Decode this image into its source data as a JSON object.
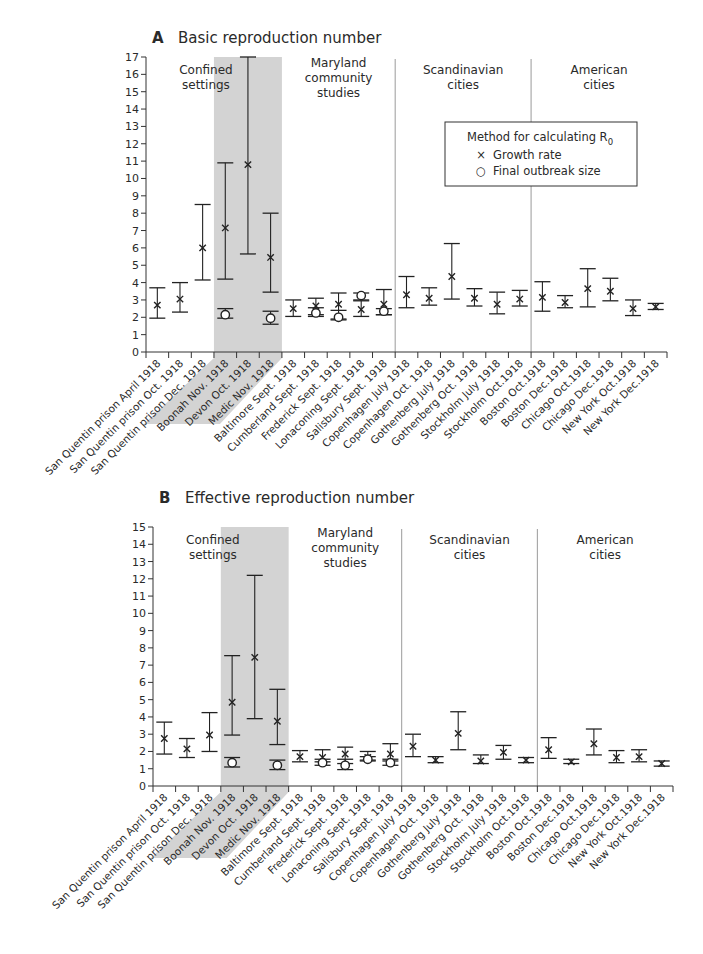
{
  "colors": {
    "axis": "#333333",
    "marker": "#222222",
    "shade": "#d3d3d3",
    "divider": "#9a9a9a",
    "text": "#2a2a2a"
  },
  "legend": {
    "title": "Method for calculating R",
    "title_subscript": "0",
    "items": [
      {
        "symbol": "×",
        "label": "Growth rate"
      },
      {
        "symbol": "○",
        "label": "Final outbreak size"
      }
    ]
  },
  "groups": [
    {
      "label_lines": [
        "Confined",
        "settings"
      ],
      "start": 0,
      "end": 6,
      "shaded_from": 3
    },
    {
      "label_lines": [
        "Maryland",
        "community",
        "studies"
      ],
      "start": 6,
      "end": 11
    },
    {
      "label_lines": [
        "Scandinavian",
        "cities"
      ],
      "start": 11,
      "end": 17
    },
    {
      "label_lines": [
        "American",
        "cities"
      ],
      "start": 17,
      "end": 23
    }
  ],
  "categories": [
    "San Quentin prison April 1918",
    "San Quentin prison Oct. 1918",
    "San Quentin prison Dec. 1918",
    "Boonah Nov. 1918",
    "Devon Oct. 1918",
    "Medic Nov. 1918",
    "Baltimore Sept. 1918",
    "Cumberland Sept. 1918",
    "Frederick Sept. 1918",
    "Lonaconing Sept. 1918",
    "Salisbury Sept. 1918",
    "Copenhagen July 1918",
    "Copenhagen Oct. 1918",
    "Gothenberg July 1918",
    "Gothenberg Oct. 1918",
    "Stockholm July 1918",
    "Stockholm Oct.1918",
    "Boston Oct.1918",
    "Boston Dec.1918",
    "Chicago Oct.1918",
    "Chicago Dec.1918",
    "New York Oct.1918",
    "New York Dec.1918"
  ],
  "chart_data": [
    {
      "type": "scatter",
      "panel": "A",
      "title": "Basic reproduction number",
      "xlabel": "",
      "ylabel": "",
      "ylim": [
        0,
        17
      ],
      "yticks": [
        0,
        1,
        2,
        3,
        4,
        5,
        6,
        7,
        8,
        9,
        10,
        11,
        12,
        13,
        14,
        15,
        16,
        17
      ],
      "grid": false,
      "legend_position": "upper right (inside, over Scandinavian/American divider)",
      "categories_ref": "categories",
      "series": [
        {
          "name": "Growth rate",
          "marker": "x",
          "points": [
            {
              "i": 0,
              "value": 2.7,
              "low": 1.95,
              "high": 3.7
            },
            {
              "i": 1,
              "value": 3.05,
              "low": 2.3,
              "high": 4.0
            },
            {
              "i": 2,
              "value": 6.0,
              "low": 4.15,
              "high": 8.5
            },
            {
              "i": 3,
              "value": 7.15,
              "low": 4.2,
              "high": 10.9
            },
            {
              "i": 4,
              "value": 10.8,
              "low": 5.65,
              "high": 17.0
            },
            {
              "i": 5,
              "value": 5.45,
              "low": 3.45,
              "high": 8.0
            },
            {
              "i": 6,
              "value": 2.5,
              "low": 2.05,
              "high": 3.0
            },
            {
              "i": 7,
              "value": 2.65,
              "low": 2.15,
              "high": 3.1
            },
            {
              "i": 8,
              "value": 2.75,
              "low": 1.9,
              "high": 3.4
            },
            {
              "i": 9,
              "value": 2.45,
              "low": 2.05,
              "high": 2.95
            },
            {
              "i": 10,
              "value": 2.75,
              "low": 2.15,
              "high": 3.6
            },
            {
              "i": 11,
              "value": 3.3,
              "low": 2.55,
              "high": 4.35
            },
            {
              "i": 12,
              "value": 3.1,
              "low": 2.7,
              "high": 3.7
            },
            {
              "i": 13,
              "value": 4.35,
              "low": 3.05,
              "high": 6.25
            },
            {
              "i": 14,
              "value": 3.1,
              "low": 2.65,
              "high": 3.65
            },
            {
              "i": 15,
              "value": 2.75,
              "low": 2.2,
              "high": 3.45
            },
            {
              "i": 16,
              "value": 3.05,
              "low": 2.65,
              "high": 3.55
            },
            {
              "i": 17,
              "value": 3.15,
              "low": 2.35,
              "high": 4.05
            },
            {
              "i": 18,
              "value": 2.85,
              "low": 2.55,
              "high": 3.25
            },
            {
              "i": 19,
              "value": 3.65,
              "low": 2.6,
              "high": 4.8
            },
            {
              "i": 20,
              "value": 3.5,
              "low": 2.95,
              "high": 4.25
            },
            {
              "i": 21,
              "value": 2.5,
              "low": 2.1,
              "high": 3.0
            },
            {
              "i": 22,
              "value": 2.6,
              "low": 2.45,
              "high": 2.8
            }
          ]
        },
        {
          "name": "Final outbreak size",
          "marker": "o",
          "points": [
            {
              "i": 3,
              "value": 2.15,
              "low": 1.95,
              "high": 2.5
            },
            {
              "i": 5,
              "value": 1.95,
              "low": 1.6,
              "high": 2.35
            },
            {
              "i": 7,
              "value": 2.25,
              "low": 2.05,
              "high": 2.55
            },
            {
              "i": 8,
              "value": 2.0,
              "low": 1.85,
              "high": 2.4
            },
            {
              "i": 9,
              "value": 3.25,
              "low": 3.0,
              "high": 3.4
            },
            {
              "i": 10,
              "value": 2.35,
              "low": 2.15,
              "high": 2.5
            }
          ]
        }
      ]
    },
    {
      "type": "scatter",
      "panel": "B",
      "title": "Effective reproduction number",
      "xlabel": "",
      "ylabel": "",
      "ylim": [
        0,
        15
      ],
      "yticks": [
        0,
        1,
        2,
        3,
        4,
        5,
        6,
        7,
        8,
        9,
        10,
        11,
        12,
        13,
        14,
        15
      ],
      "grid": false,
      "categories_ref": "categories",
      "series": [
        {
          "name": "Growth rate",
          "marker": "x",
          "points": [
            {
              "i": 0,
              "value": 2.75,
              "low": 1.85,
              "high": 3.7
            },
            {
              "i": 1,
              "value": 2.15,
              "low": 1.65,
              "high": 2.75
            },
            {
              "i": 2,
              "value": 2.95,
              "low": 2.0,
              "high": 4.25
            },
            {
              "i": 3,
              "value": 4.85,
              "low": 2.95,
              "high": 7.55
            },
            {
              "i": 4,
              "value": 7.45,
              "low": 3.9,
              "high": 12.2
            },
            {
              "i": 5,
              "value": 3.75,
              "low": 2.4,
              "high": 5.6
            },
            {
              "i": 6,
              "value": 1.7,
              "low": 1.4,
              "high": 2.05
            },
            {
              "i": 7,
              "value": 1.65,
              "low": 1.4,
              "high": 2.1
            },
            {
              "i": 8,
              "value": 1.85,
              "low": 1.3,
              "high": 2.25
            },
            {
              "i": 9,
              "value": 1.65,
              "low": 1.5,
              "high": 2.0
            },
            {
              "i": 10,
              "value": 1.85,
              "low": 1.45,
              "high": 2.45
            },
            {
              "i": 11,
              "value": 2.3,
              "low": 1.7,
              "high": 3.0
            },
            {
              "i": 12,
              "value": 1.5,
              "low": 1.35,
              "high": 1.7
            },
            {
              "i": 13,
              "value": 3.05,
              "low": 2.1,
              "high": 4.3
            },
            {
              "i": 14,
              "value": 1.45,
              "low": 1.3,
              "high": 1.8
            },
            {
              "i": 15,
              "value": 1.95,
              "low": 1.55,
              "high": 2.35
            },
            {
              "i": 16,
              "value": 1.5,
              "low": 1.35,
              "high": 1.65
            },
            {
              "i": 17,
              "value": 2.1,
              "low": 1.6,
              "high": 2.8
            },
            {
              "i": 18,
              "value": 1.4,
              "low": 1.3,
              "high": 1.55
            },
            {
              "i": 19,
              "value": 2.45,
              "low": 1.8,
              "high": 3.3
            },
            {
              "i": 20,
              "value": 1.65,
              "low": 1.35,
              "high": 2.05
            },
            {
              "i": 21,
              "value": 1.7,
              "low": 1.4,
              "high": 2.1
            },
            {
              "i": 22,
              "value": 1.3,
              "low": 1.15,
              "high": 1.45
            }
          ]
        },
        {
          "name": "Final outbreak size",
          "marker": "o",
          "points": [
            {
              "i": 3,
              "value": 1.35,
              "low": 1.1,
              "high": 1.65
            },
            {
              "i": 5,
              "value": 1.2,
              "low": 0.95,
              "high": 1.5
            },
            {
              "i": 7,
              "value": 1.35,
              "low": 1.2,
              "high": 1.55
            },
            {
              "i": 8,
              "value": 1.2,
              "low": 0.95,
              "high": 1.55
            },
            {
              "i": 9,
              "value": 1.55,
              "low": 1.45,
              "high": 1.7
            },
            {
              "i": 10,
              "value": 1.35,
              "low": 1.2,
              "high": 1.55
            }
          ]
        }
      ]
    }
  ],
  "panels_layout": [
    {
      "letter": "A",
      "title_ref": 0,
      "x0": 146,
      "x1": 667,
      "y_top": 57,
      "y_bottom": 352,
      "title_y": 43,
      "show_legend": true
    },
    {
      "letter": "B",
      "title_ref": 1,
      "x0": 153,
      "x1": 673,
      "y_top": 527,
      "y_bottom": 786,
      "title_y": 503,
      "show_legend": false
    }
  ]
}
